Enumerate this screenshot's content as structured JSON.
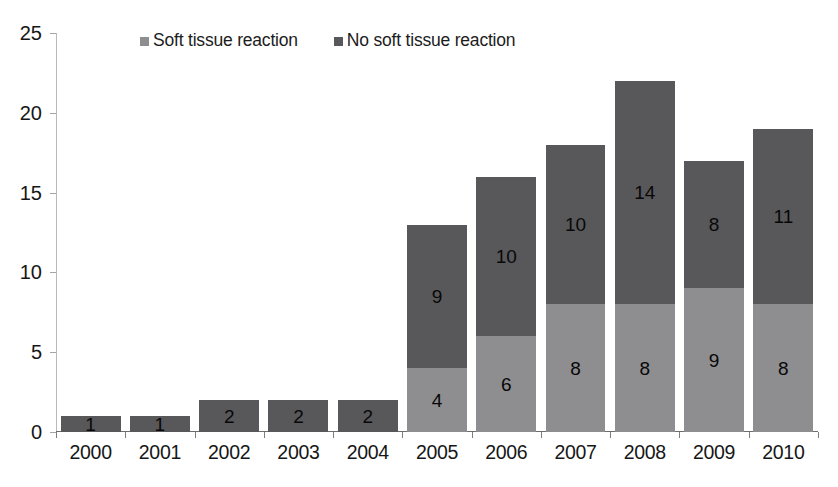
{
  "chart_data": {
    "type": "bar",
    "subtype": "stacked-vertical",
    "title": "",
    "xlabel": "",
    "ylabel": "",
    "ylim": [
      0,
      25
    ],
    "ytick_values": [
      0,
      5,
      10,
      15,
      20,
      25
    ],
    "ytick_labels": [
      "0",
      "5",
      "10",
      "15",
      "20",
      "25"
    ],
    "grid": false,
    "legend_position": "top-center",
    "categories": [
      "2000",
      "2001",
      "2002",
      "2003",
      "2004",
      "2005",
      "2006",
      "2007",
      "2008",
      "2009",
      "2010"
    ],
    "series": [
      {
        "name": "Soft tissue reaction",
        "color": "#8e8e90",
        "values": [
          0,
          0,
          0,
          0,
          0,
          4,
          6,
          8,
          8,
          9,
          8
        ],
        "labels": [
          "",
          "",
          "",
          "",
          "",
          "4",
          "6",
          "8",
          "8",
          "9",
          "8"
        ]
      },
      {
        "name": "No soft tissue reaction",
        "color": "#58585a",
        "values": [
          1,
          1,
          2,
          2,
          2,
          9,
          10,
          10,
          14,
          8,
          11
        ],
        "labels": [
          "1",
          "1",
          "2",
          "2",
          "2",
          "9",
          "10",
          "10",
          "14",
          "8",
          "11"
        ]
      }
    ],
    "totals": [
      1,
      1,
      2,
      2,
      2,
      13,
      16,
      18,
      22,
      17,
      19
    ]
  },
  "legend": {
    "items": [
      {
        "label": "Soft tissue reaction",
        "color": "#8e8e90"
      },
      {
        "label": "No soft tissue reaction",
        "color": "#58585a"
      }
    ]
  },
  "colors": {
    "soft_tissue_reaction": "#8e8e90",
    "no_soft_tissue_reaction": "#58585a",
    "axis": "#6d6d6d",
    "text": "#161616",
    "background": "#ffffff"
  }
}
